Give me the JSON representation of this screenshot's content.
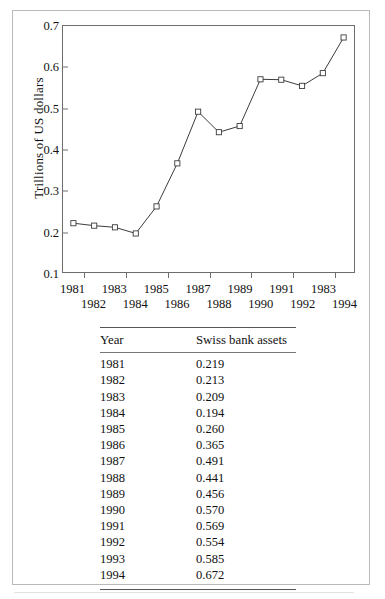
{
  "figure": {
    "y_axis_label": "Trillions of US dollars",
    "y_ticks": [
      "0.1",
      "0.2",
      "0.3",
      "0.4",
      "0.5",
      "0.6",
      "0.7"
    ],
    "x_ticks_top_row": [
      "1981",
      "1983",
      "1985",
      "1987",
      "1989",
      "1991",
      "1983"
    ],
    "x_ticks_bottom_row": [
      "1982",
      "1984",
      "1986",
      "1988",
      "1990",
      "1992",
      "1994"
    ]
  },
  "table": {
    "headers": [
      "Year",
      "Swiss bank assets"
    ],
    "rows": [
      {
        "year": "1981",
        "value": "0.219"
      },
      {
        "year": "1982",
        "value": "0.213"
      },
      {
        "year": "1983",
        "value": "0.209"
      },
      {
        "year": "1984",
        "value": "0.194"
      },
      {
        "year": "1985",
        "value": "0.260"
      },
      {
        "year": "1986",
        "value": "0.365"
      },
      {
        "year": "1987",
        "value": "0.491"
      },
      {
        "year": "1988",
        "value": "0.441"
      },
      {
        "year": "1989",
        "value": "0.456"
      },
      {
        "year": "1990",
        "value": "0.570"
      },
      {
        "year": "1991",
        "value": "0.569"
      },
      {
        "year": "1992",
        "value": "0.554"
      },
      {
        "year": "1993",
        "value": "0.585"
      },
      {
        "year": "1994",
        "value": "0.672"
      }
    ]
  },
  "colors": {
    "line": "#3a3a3a",
    "marker_stroke": "#3a3a3a",
    "marker_fill": "#ffffff",
    "frame": "#6e6e6e",
    "rule": "#555555",
    "page_border": "#b9b9b9",
    "text": "#111111"
  },
  "chart_data": {
    "type": "line",
    "title": "",
    "xlabel": "",
    "ylabel": "Trillions of US dollars",
    "x": [
      1981,
      1982,
      1983,
      1984,
      1985,
      1986,
      1987,
      1988,
      1989,
      1990,
      1991,
      1992,
      1993,
      1994
    ],
    "xtick_labels": [
      "1981",
      "1982",
      "1983",
      "1984",
      "1985",
      "1986",
      "1987",
      "1988",
      "1989",
      "1990",
      "1991",
      "1992",
      "1983",
      "1994"
    ],
    "series": [
      {
        "name": "Swiss bank assets",
        "values": [
          0.219,
          0.213,
          0.209,
          0.194,
          0.26,
          0.365,
          0.491,
          0.441,
          0.456,
          0.57,
          0.569,
          0.554,
          0.585,
          0.672
        ]
      }
    ],
    "xlim": [
      1980.5,
      1994.5
    ],
    "ylim": [
      0.1,
      0.7
    ],
    "yticks": [
      0.1,
      0.2,
      0.3,
      0.4,
      0.5,
      0.6,
      0.7
    ],
    "grid": false,
    "legend": false,
    "marker": "open-square",
    "line_style": "solid"
  }
}
